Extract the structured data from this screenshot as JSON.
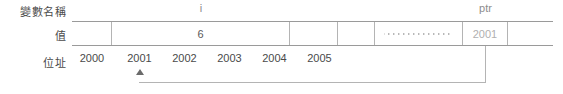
{
  "diagram": {
    "row_labels": {
      "variable_name": "變數名稱",
      "value": "值",
      "address": "位址"
    },
    "variable_names": [
      {
        "id": "i",
        "label": "i",
        "left": 112,
        "width": 178
      },
      {
        "id": "ptr",
        "label": "ptr",
        "left": 463,
        "width": 45
      }
    ],
    "cells": [
      {
        "id": "cell-2000",
        "value": "",
        "left": 0,
        "width": 40,
        "style": "plain",
        "divider_left": false,
        "divider_right": true
      },
      {
        "id": "cell-i",
        "value": "6",
        "left": 40,
        "width": 178,
        "style": "plain",
        "divider_left": false,
        "divider_right": true
      },
      {
        "id": "cell-2003",
        "value": "",
        "left": 218,
        "width": 48,
        "style": "plain",
        "divider_left": false,
        "divider_right": true
      },
      {
        "id": "cell-2004",
        "value": "",
        "left": 266,
        "width": 37,
        "style": "plain",
        "divider_left": false,
        "divider_right": true
      },
      {
        "id": "cell-dots",
        "value": "",
        "left": 303,
        "width": 88,
        "style": "dots",
        "divider_left": false,
        "divider_right": true
      },
      {
        "id": "cell-ptr",
        "value": "2001",
        "left": 391,
        "width": 45,
        "style": "gray",
        "divider_left": false,
        "divider_right": true
      },
      {
        "id": "cell-last",
        "value": "",
        "left": 436,
        "width": 45,
        "style": "plain",
        "divider_left": false,
        "divider_right": false
      }
    ],
    "addresses": [
      {
        "label": "2000",
        "left": 72,
        "width": 40
      },
      {
        "label": "2001",
        "left": 117,
        "width": 45
      },
      {
        "label": "2002",
        "left": 162,
        "width": 45
      },
      {
        "label": "2003",
        "left": 207,
        "width": 45
      },
      {
        "label": "2004",
        "left": 252,
        "width": 45
      },
      {
        "label": "2005",
        "left": 297,
        "width": 45
      }
    ],
    "pointer_link": {
      "from_address": "2001",
      "to_cell": "cell-ptr",
      "description": "ptr holds address 2001 which points at variable i"
    },
    "colors": {
      "text": "#4a4a4a",
      "muted_text": "#8d8d8d",
      "gray_value": "#b0b0b0",
      "table_border": "#9a9a9a",
      "cell_divider": "#b4b4b4",
      "arrow": "#6b6b6b",
      "background": "#ffffff"
    }
  }
}
